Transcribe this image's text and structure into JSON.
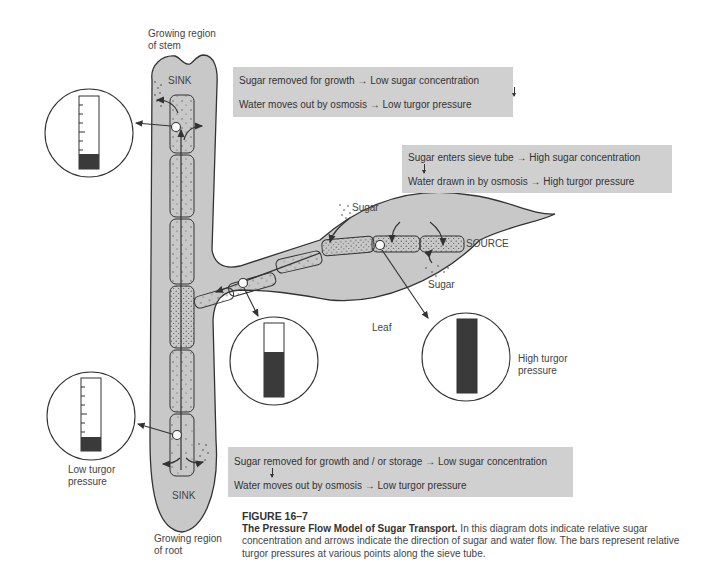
{
  "labels": {
    "stem_top": [
      "Growing region",
      "of stem"
    ],
    "root_bottom": [
      "Growing region",
      "of root"
    ],
    "sink_top": "SINK",
    "sink_bottom": "SINK",
    "source": "SOURCE",
    "sugar_top": "Sugar",
    "sugar_bottom": "Sugar",
    "leaf": "Leaf",
    "high_turgor": [
      "High turgor",
      "pressure"
    ],
    "low_turgor": [
      "Low turgor",
      "pressure"
    ]
  },
  "boxes": {
    "sink_top": {
      "line1": "Sugar removed for growth → Low sugar concentration",
      "line2": "Water moves out by osmosis → Low turgor pressure"
    },
    "source": {
      "line1": "Sugar enters sieve tube → High sugar concentration",
      "line2": "Water drawn in by osmosis → High turgor pressure"
    },
    "sink_bottom": {
      "line1": "Sugar removed for growth and / or storage → Low sugar concentration",
      "line2": "Water moves out by osmosis → Low turgor pressure"
    }
  },
  "gauges": [
    {
      "id": "stem-sink",
      "fill_fraction": 0.2
    },
    {
      "id": "junction",
      "fill_fraction": 0.6
    },
    {
      "id": "source",
      "fill_fraction": 1.0
    },
    {
      "id": "root-sink",
      "fill_fraction": 0.2
    }
  ],
  "caption": {
    "figure": "FIGURE 16–7",
    "title": "The Pressure Flow Model of Sugar Transport.",
    "text": " In this diagram dots indicate relative sugar concentration and arrows indicate the direction of sugar and water flow. The bars represent relative turgor pressures at various points along the sieve tube."
  },
  "colors": {
    "tissue": "#c8c8c8",
    "box": "#d0d0d0",
    "outline": "#333333",
    "gauge_fill": "#3a3a3a"
  }
}
